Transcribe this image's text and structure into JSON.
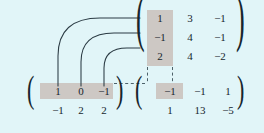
{
  "figure": {
    "kind": "matrix-multiplication-diagram",
    "background_color": "#e1f5f8",
    "highlight_color": "#cdc8c4",
    "ink_color": "#16262e"
  },
  "matrices": {
    "right_factor": {
      "name": "right-factor-matrix",
      "rows": 3,
      "cols": 3,
      "values": [
        [
          "1",
          "3",
          "-1"
        ],
        [
          "-1",
          "4",
          "-1"
        ],
        [
          "2",
          "4",
          "-2"
        ]
      ],
      "highlighted_column_index": 0,
      "highlighted_cells": [
        "1",
        "-1",
        "2"
      ]
    },
    "left_factor": {
      "name": "left-factor-matrix",
      "rows": 2,
      "cols": 3,
      "values": [
        [
          "1",
          "0",
          "-1"
        ],
        [
          "-1",
          "2",
          "2"
        ]
      ],
      "highlighted_row_index": 0,
      "highlighted_cells": [
        "1",
        "0",
        "-1"
      ]
    },
    "product": {
      "name": "product-matrix",
      "rows": 2,
      "cols": 3,
      "values": [
        [
          "-1",
          "-1",
          "1"
        ],
        [
          "1",
          "13",
          "-5"
        ]
      ],
      "highlighted_cell": "-1",
      "highlighted_cell_position": [
        0,
        0
      ]
    }
  },
  "delimiters": {
    "left_paren": "(",
    "right_paren": ")"
  },
  "connectors": {
    "arcs": [
      {
        "name": "arc-pair-1",
        "from_cell": "1",
        "to_cell": "1"
      },
      {
        "name": "arc-pair-2",
        "from_cell": "0",
        "to_cell": "-1"
      },
      {
        "name": "arc-pair-3",
        "from_cell": "-1",
        "to_cell": "2"
      }
    ],
    "dashed_guides": [
      {
        "name": "dashed-column-left",
        "orientation": "vertical"
      },
      {
        "name": "dashed-column-right",
        "orientation": "vertical"
      },
      {
        "name": "dashed-row-guide",
        "orientation": "horizontal"
      }
    ]
  }
}
